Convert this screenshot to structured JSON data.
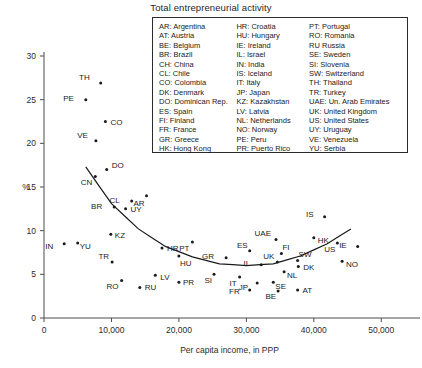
{
  "chart": {
    "title": "Total entrepreneurial activity",
    "xlabel": "Per capita income, in PPP",
    "ylabel": "%"
  },
  "legend": {
    "col1": [
      "AR: Argentina",
      "AT: Austria",
      "BE: Belgium",
      "BR: Brazil",
      "CH: China",
      "CL: Chile",
      "CO: Colombia",
      "DK: Denmark",
      "DO: Dominican Rep.",
      "ES: Spain",
      "FI: Finland",
      "FR: France",
      "GR: Greece",
      "HK: Hong Kong"
    ],
    "col2": [
      "HR: Croatia",
      "HU: Hungary",
      "IE: Ireland",
      "IL: Israel",
      "IN: India",
      "IS: Iceland",
      "IT: Italy",
      "JP: Japan",
      "KZ: Kazakhstan",
      "LV: Latvia",
      "NL: Netherlands",
      "NO: Norway",
      "PE: Peru",
      "PR: Puerto Rico"
    ],
    "col3": [
      "PT: Portugal",
      "RO: Romania",
      "RU Russia",
      "SE: Sweden",
      "SI: Slovenia",
      "SW: Switzerland",
      "TH: Thailand",
      "TR: Turkey",
      "UAE: Un. Arab Emirates",
      "UK: United Kingdom",
      "US: United States",
      "UY: Uruguay",
      "VE: Venezuela",
      "YU: Serbia"
    ]
  },
  "chart_data": {
    "type": "scatter",
    "title": "Total entrepreneurial activity",
    "xlabel": "Per capita income, in PPP",
    "ylabel": "%",
    "xlim": [
      0,
      55000
    ],
    "ylim": [
      0,
      30
    ],
    "xticks": [
      0,
      10000,
      20000,
      30000,
      40000,
      50000
    ],
    "xticklabels": [
      "0",
      "10,000",
      "20,000",
      "30,000",
      "40,000",
      "50,000"
    ],
    "yticks": [
      0,
      5,
      10,
      15,
      20,
      25,
      30
    ],
    "yticklabels": [
      "0",
      "5",
      "10",
      "15",
      "20",
      "25",
      "30"
    ],
    "grid": false,
    "legend_position": "top-center-inside",
    "series": [
      {
        "name": "Countries",
        "points": [
          {
            "code": "TH",
            "x": 8400,
            "y": 26.9,
            "lx": -11,
            "ly": -3
          },
          {
            "code": "PE",
            "x": 6200,
            "y": 25.0,
            "lx": -12,
            "ly": 1
          },
          {
            "code": "CO",
            "x": 9100,
            "y": 22.5,
            "lx": 5,
            "ly": 3
          },
          {
            "code": "VE",
            "x": 7700,
            "y": 20.3,
            "lx": -8,
            "ly": -3
          },
          {
            "code": "DO",
            "x": 9300,
            "y": 17.0,
            "lx": 5,
            "ly": -2
          },
          {
            "code": "CN",
            "x": 7600,
            "y": 16.2,
            "lx": -3,
            "ly": 8
          },
          {
            "code": "CL",
            "x": 13000,
            "y": 13.4,
            "lx": -12,
            "ly": 2
          },
          {
            "code": "AR",
            "x": 15200,
            "y": 14.0,
            "lx": -2,
            "ly": 10
          },
          {
            "code": "BR",
            "x": 10400,
            "y": 12.7,
            "lx": -12,
            "ly": 2
          },
          {
            "code": "UY",
            "x": 12100,
            "y": 12.5,
            "lx": 5,
            "ly": 3
          },
          {
            "code": "KZ",
            "x": 9900,
            "y": 9.6,
            "lx": 4,
            "ly": 4
          },
          {
            "code": "IN",
            "x": 3000,
            "y": 8.5,
            "lx": -11,
            "ly": 5
          },
          {
            "code": "YU",
            "x": 5000,
            "y": 8.6,
            "lx": 2,
            "ly": 6
          },
          {
            "code": "HR",
            "x": 17500,
            "y": 8.0,
            "lx": 5,
            "ly": 3
          },
          {
            "code": "HU",
            "x": 20000,
            "y": 7.1,
            "lx": 1,
            "ly": 10
          },
          {
            "code": "TR",
            "x": 10100,
            "y": 6.4,
            "lx": -3,
            "ly": -3
          },
          {
            "code": "PT",
            "x": 22000,
            "y": 8.7,
            "lx": -3,
            "ly": 9
          },
          {
            "code": "LV",
            "x": 16500,
            "y": 4.9,
            "lx": 5,
            "ly": 5
          },
          {
            "code": "PR",
            "x": 20000,
            "y": 4.1,
            "lx": 4,
            "ly": 3
          },
          {
            "code": "RO",
            "x": 11500,
            "y": 4.3,
            "lx": -3,
            "ly": 9
          },
          {
            "code": "RU",
            "x": 14200,
            "y": 3.5,
            "lx": 5,
            "ly": 3
          },
          {
            "code": "GR",
            "x": 27000,
            "y": 6.9,
            "lx": -12,
            "ly": 1
          },
          {
            "code": "SI",
            "x": 25200,
            "y": 5.0,
            "lx": -2,
            "ly": 9
          },
          {
            "code": "IT",
            "x": 29000,
            "y": 4.7,
            "lx": -3,
            "ly": 9
          },
          {
            "code": "ES",
            "x": 30500,
            "y": 7.7,
            "lx": -2,
            "ly": -3
          },
          {
            "code": "IL",
            "x": 32200,
            "y": 6.1,
            "lx": -11,
            "ly": 1
          },
          {
            "code": "UK",
            "x": 34600,
            "y": 6.4,
            "lx": -3,
            "ly": -3
          },
          {
            "code": "UAE",
            "x": 34400,
            "y": 9.0,
            "lx": -5,
            "ly": -3
          },
          {
            "code": "FI",
            "x": 35200,
            "y": 7.4,
            "lx": 1,
            "ly": -3
          },
          {
            "code": "SW",
            "x": 37600,
            "y": 6.6,
            "lx": 1,
            "ly": -3
          },
          {
            "code": "DK",
            "x": 37700,
            "y": 5.9,
            "lx": 5,
            "ly": 3
          },
          {
            "code": "NL",
            "x": 35600,
            "y": 5.3,
            "lx": 3,
            "ly": 6
          },
          {
            "code": "SE",
            "x": 34000,
            "y": 4.1,
            "lx": 2,
            "ly": 7
          },
          {
            "code": "JP",
            "x": 31600,
            "y": 4.0,
            "lx": -9,
            "ly": 7
          },
          {
            "code": "BE",
            "x": 34700,
            "y": 3.1,
            "lx": -2,
            "ly": 8
          },
          {
            "code": "AT",
            "x": 37600,
            "y": 3.2,
            "lx": 5,
            "ly": 3
          },
          {
            "code": "FR",
            "x": 30500,
            "y": 3.2,
            "lx": -10,
            "ly": 4
          },
          {
            "code": "IS",
            "x": 41600,
            "y": 11.6,
            "lx": -11,
            "ly": 0
          },
          {
            "code": "HK",
            "x": 40000,
            "y": 9.2,
            "lx": 4,
            "ly": 5
          },
          {
            "code": "US",
            "x": 43500,
            "y": 8.6,
            "lx": -2,
            "ly": 9
          },
          {
            "code": "IE",
            "x": 46500,
            "y": 8.2,
            "lx": -11,
            "ly": 2
          },
          {
            "code": "NO",
            "x": 44200,
            "y": 6.5,
            "lx": 4,
            "ly": 6
          }
        ]
      }
    ],
    "trend_curve": {
      "description": "U-shaped quadratic fit of entrepreneurial activity vs per capita income",
      "points": [
        {
          "x": 6200,
          "y": 17.3
        },
        {
          "x": 10000,
          "y": 13.1
        },
        {
          "x": 14000,
          "y": 10.2
        },
        {
          "x": 18000,
          "y": 8.2
        },
        {
          "x": 22000,
          "y": 7.0
        },
        {
          "x": 26000,
          "y": 6.2
        },
        {
          "x": 30000,
          "y": 6.0
        },
        {
          "x": 34000,
          "y": 6.2
        },
        {
          "x": 38000,
          "y": 7.1
        },
        {
          "x": 42000,
          "y": 8.5
        },
        {
          "x": 45500,
          "y": 10.2
        }
      ]
    }
  }
}
